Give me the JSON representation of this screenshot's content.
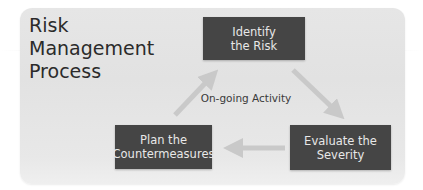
{
  "diagram": {
    "title_lines": [
      "Risk",
      "Management",
      "Process"
    ],
    "center_label": "On-going Activity",
    "nodes": [
      {
        "id": "identify",
        "lines": [
          "Identify",
          "the Risk"
        ]
      },
      {
        "id": "evaluate",
        "lines": [
          "Evaluate the",
          "Severity"
        ]
      },
      {
        "id": "plan",
        "lines": [
          "Plan the",
          "Countermeasures"
        ]
      }
    ],
    "edges": [
      {
        "from": "identify",
        "to": "evaluate"
      },
      {
        "from": "evaluate",
        "to": "plan"
      },
      {
        "from": "plan",
        "to": "identify"
      }
    ],
    "colors": {
      "panel": "#e4e4e4",
      "node_fill": "#454545",
      "node_text": "#e8e8e8",
      "arrow": "#c8c8c8",
      "title_text": "#2b2b2b"
    }
  }
}
